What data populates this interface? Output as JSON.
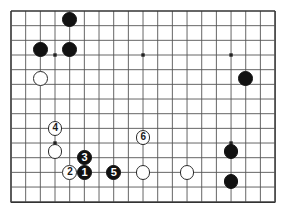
{
  "figure": {
    "kind": "go-board-diagram",
    "background_color": "#ffffff"
  },
  "board": {
    "line_color": "#555555",
    "edge_color": "#333333",
    "star_color": "#222222",
    "origin_x": 11,
    "origin_y": 11,
    "spacing": 14.67,
    "columns": 19,
    "rows": 14,
    "visible_region": "top portion of a 19x19 board, cropped below row 14",
    "star_points": [
      {
        "col": 3,
        "row": 3
      },
      {
        "col": 9,
        "row": 3
      },
      {
        "col": 15,
        "row": 3
      },
      {
        "col": 3,
        "row": 9
      },
      {
        "col": 9,
        "row": 9
      },
      {
        "col": 15,
        "row": 9
      }
    ]
  },
  "stones": [
    {
      "id": "b-top",
      "color": "black",
      "col": 4,
      "row": 0.6,
      "label": ""
    },
    {
      "id": "b-left-upper",
      "color": "black",
      "col": 2,
      "row": 2.6,
      "label": ""
    },
    {
      "id": "b-mid-upper",
      "color": "black",
      "col": 4,
      "row": 2.6,
      "label": ""
    },
    {
      "id": "w-left-upper",
      "color": "white",
      "col": 2,
      "row": 4.6,
      "label": ""
    },
    {
      "id": "b-right-upper",
      "color": "black",
      "col": 16,
      "row": 4.6,
      "label": ""
    },
    {
      "id": "w-move-4",
      "color": "white",
      "col": 3,
      "row": 8,
      "label": "4"
    },
    {
      "id": "w-left-lower",
      "color": "white",
      "col": 3,
      "row": 9.6,
      "label": ""
    },
    {
      "id": "w-move-2",
      "color": "white",
      "col": 4,
      "row": 11,
      "label": "2"
    },
    {
      "id": "b-move-1",
      "color": "black",
      "col": 5,
      "row": 11,
      "label": "1"
    },
    {
      "id": "b-move-3",
      "color": "black",
      "col": 5,
      "row": 10,
      "label": "3"
    },
    {
      "id": "b-move-5",
      "color": "black",
      "col": 7,
      "row": 11,
      "label": "5"
    },
    {
      "id": "w-move-6",
      "color": "white",
      "col": 9,
      "row": 8.6,
      "label": "6"
    },
    {
      "id": "w-center-low",
      "color": "white",
      "col": 9,
      "row": 11,
      "label": ""
    },
    {
      "id": "w-right-low",
      "color": "white",
      "col": 12,
      "row": 11,
      "label": ""
    },
    {
      "id": "b-right-a",
      "color": "black",
      "col": 15,
      "row": 9.6,
      "label": ""
    },
    {
      "id": "b-right-b",
      "color": "black",
      "col": 15,
      "row": 11.6,
      "label": ""
    }
  ],
  "stone_radius": 7.4
}
